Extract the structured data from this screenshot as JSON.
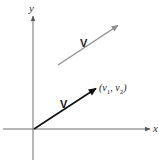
{
  "diagram": {
    "title": "",
    "axes": {
      "x_label": "x",
      "y_label": "y",
      "origin": [
        33,
        129
      ],
      "x_axis": {
        "from": [
          3,
          129
        ],
        "to": [
          151,
          129
        ]
      },
      "y_axis": {
        "from": [
          33,
          160
        ],
        "to": [
          33,
          15
        ]
      }
    },
    "vectors": [
      {
        "id": "position-vector",
        "label": "V",
        "from": [
          34,
          129
        ],
        "to": [
          97,
          88
        ],
        "color": "#111111",
        "endpoint_label": "(v₁, v₂)",
        "endpoint_label_parts": {
          "open": "(",
          "v1": "v",
          "sub1": "1",
          "sep": ", ",
          "v2": "v",
          "sub2": "2",
          "close": ")"
        }
      },
      {
        "id": "translated-vector",
        "label": "V",
        "from": [
          58,
          65
        ],
        "to": [
          119,
          25
        ],
        "color": "#8f8f8f"
      }
    ],
    "colors": {
      "axis": "#6f6f6f",
      "black_vector": "#111111",
      "gray_vector": "#8f8f8f",
      "text": "#333333"
    }
  }
}
